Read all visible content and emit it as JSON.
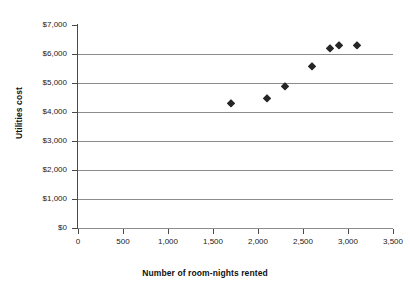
{
  "chart_data": {
    "type": "scatter",
    "title": "",
    "xlabel": "Number of room-nights rented",
    "ylabel": "Utilities cost",
    "xlim": [
      0,
      3500
    ],
    "ylim": [
      0,
      7000
    ],
    "grid": true,
    "legend": null,
    "x_ticks": [
      0,
      500,
      1000,
      1500,
      2000,
      2500,
      3000,
      3500
    ],
    "x_tick_labels": [
      "0",
      "500",
      "1,000",
      "1,500",
      "2,000",
      "2,500",
      "3,000",
      "3,500"
    ],
    "y_ticks": [
      0,
      1000,
      2000,
      3000,
      4000,
      5000,
      6000,
      7000
    ],
    "y_tick_labels": [
      "$0",
      "$1,000",
      "$2,000",
      "$3,000",
      "$4,000",
      "$5,000",
      "$6,000",
      "$7,000"
    ],
    "series": [
      {
        "name": "Utilities cost vs room-nights",
        "marker": "diamond",
        "color": "#262626",
        "points": [
          {
            "x": 1700,
            "y": 4300
          },
          {
            "x": 2100,
            "y": 4500
          },
          {
            "x": 2300,
            "y": 4900
          },
          {
            "x": 2600,
            "y": 5600
          },
          {
            "x": 2800,
            "y": 6200
          },
          {
            "x": 2900,
            "y": 6300
          },
          {
            "x": 3100,
            "y": 6300
          }
        ]
      }
    ]
  },
  "colors": {
    "marker": "#262626",
    "gridline": "#8c8c8c",
    "axis": "#4a4a4a",
    "text": "#1a1a1a",
    "background": "#ffffff"
  }
}
